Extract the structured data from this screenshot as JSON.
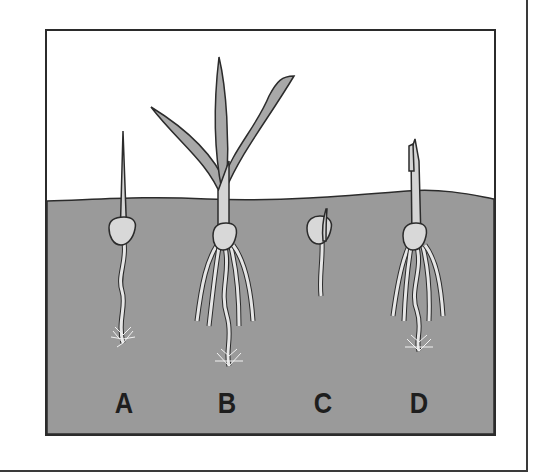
{
  "figure": {
    "colors": {
      "soil": "#9a9a9a",
      "sky": "#ffffff",
      "leaf": "#a8a8a8",
      "stem": "#d4d4d4",
      "seed": "#d8d8d8",
      "outline": "#2b2b2b"
    },
    "seedlings": [
      {
        "label": "A",
        "stage": "shoot emerged, single root with root hairs"
      },
      {
        "label": "B",
        "stage": "full plant with leaves, many roots and root hairs"
      },
      {
        "label": "C",
        "stage": "germinating seed below soil, short root and shoot"
      },
      {
        "label": "D",
        "stage": "shoot emerged, multiple roots with root hairs"
      }
    ]
  }
}
